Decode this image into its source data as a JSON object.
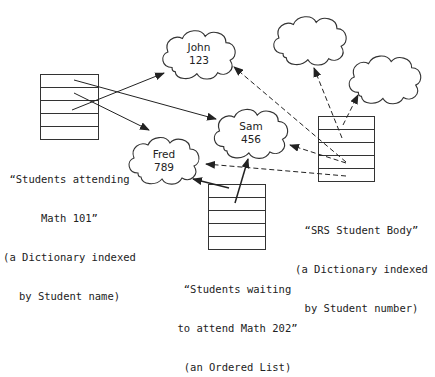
{
  "diagram": {
    "objects": [
      {
        "id": "john",
        "name": "John",
        "number": "123"
      },
      {
        "id": "sam",
        "name": "Sam",
        "number": "456"
      },
      {
        "id": "fred",
        "name": "Fred",
        "number": "789"
      },
      {
        "id": "anon1",
        "name": "",
        "number": ""
      },
      {
        "id": "anon2",
        "name": "",
        "number": ""
      }
    ],
    "collections": [
      {
        "id": "math101",
        "line1": "“Students attending",
        "line2": "Math 101”",
        "line3": "(a Dictionary indexed",
        "line4": "by Student name)"
      },
      {
        "id": "srs",
        "line1": "“SRS Student Body”",
        "line2": "(a Dictionary indexed",
        "line3": "by Student number)"
      },
      {
        "id": "math202",
        "line1": "“Students waiting",
        "line2": "to attend Math 202”",
        "line3": "(an Ordered List)"
      }
    ],
    "references": [
      {
        "from": "math101",
        "to": "john",
        "style": "solid"
      },
      {
        "from": "math101",
        "to": "sam",
        "style": "solid"
      },
      {
        "from": "math101",
        "to": "fred",
        "style": "solid"
      },
      {
        "from": "math202",
        "to": "fred",
        "style": "solid"
      },
      {
        "from": "math202",
        "to": "sam",
        "style": "solid"
      },
      {
        "from": "srs",
        "to": "john",
        "style": "dashed"
      },
      {
        "from": "srs",
        "to": "sam",
        "style": "dashed"
      },
      {
        "from": "srs",
        "to": "fred",
        "style": "dashed"
      },
      {
        "from": "srs",
        "to": "anon1",
        "style": "dashed"
      },
      {
        "from": "srs",
        "to": "anon2",
        "style": "dashed"
      }
    ]
  }
}
